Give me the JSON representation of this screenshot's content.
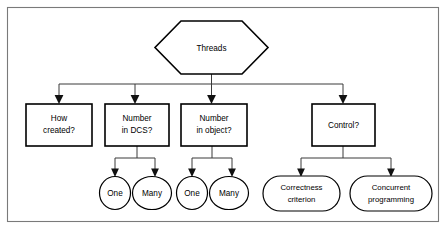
{
  "diagram": {
    "title": "Threads",
    "type": "tree-taxonomy",
    "frame": {
      "border_color": "#7a7a7a",
      "background": "#ffffff"
    },
    "root": {
      "id": "threads",
      "shape": "hexagon",
      "label": "Threads",
      "x": 155,
      "y": 21,
      "w": 113,
      "h": 53
    },
    "level1": [
      {
        "id": "how-created",
        "shape": "rectangle",
        "label_line1": "How",
        "label_line2": "created?",
        "x": 26,
        "y": 104,
        "w": 66,
        "h": 42,
        "children": []
      },
      {
        "id": "number-in-dcs",
        "shape": "rectangle",
        "label_line1": "Number",
        "label_line2": "in DCS?",
        "x": 105,
        "y": 104,
        "w": 64,
        "h": 42,
        "children": [
          "one-dcs",
          "many-dcs"
        ]
      },
      {
        "id": "number-in-object",
        "shape": "rectangle",
        "label_line1": "Number",
        "label_line2": "in object?",
        "x": 181,
        "y": 104,
        "w": 66,
        "h": 42,
        "children": [
          "one-object",
          "many-object"
        ]
      },
      {
        "id": "control",
        "shape": "rectangle",
        "label_line1": "Control?",
        "label_line2": "",
        "x": 312,
        "y": 104,
        "w": 63,
        "h": 42,
        "children": [
          "correctness-criterion",
          "concurrent-programming"
        ]
      }
    ],
    "level2": [
      {
        "id": "one-dcs",
        "shape": "ellipse",
        "label_line1": "One",
        "label_line2": "",
        "cx": 115,
        "cy": 193,
        "rx": 15.5,
        "ry": 16.5,
        "parent": "number-in-dcs"
      },
      {
        "id": "many-dcs",
        "shape": "ellipse",
        "label_line1": "Many",
        "label_line2": "",
        "cx": 152,
        "cy": 193,
        "rx": 19.5,
        "ry": 16.5,
        "parent": "number-in-dcs"
      },
      {
        "id": "one-object",
        "shape": "ellipse",
        "label_line1": "One",
        "label_line2": "",
        "cx": 192,
        "cy": 193,
        "rx": 15.5,
        "ry": 16.5,
        "parent": "number-in-object"
      },
      {
        "id": "many-object",
        "shape": "ellipse",
        "label_line1": "Many",
        "label_line2": "",
        "cx": 229,
        "cy": 193,
        "rx": 19.5,
        "ry": 16.5,
        "parent": "number-in-object"
      },
      {
        "id": "correctness-criterion",
        "shape": "stadium",
        "label_line1": "Correctness",
        "label_line2": "criterion",
        "x": 263,
        "y": 176,
        "w": 77,
        "h": 35,
        "parent": "control"
      },
      {
        "id": "concurrent-programming",
        "shape": "stadium",
        "label_line1": "Concurrent",
        "label_line2": "programming",
        "x": 350,
        "y": 176,
        "w": 82,
        "h": 35,
        "parent": "control"
      }
    ],
    "edges": [
      {
        "from": "threads",
        "to": "how-created"
      },
      {
        "from": "threads",
        "to": "number-in-dcs"
      },
      {
        "from": "threads",
        "to": "number-in-object"
      },
      {
        "from": "threads",
        "to": "control"
      },
      {
        "from": "number-in-dcs",
        "to": "one-dcs"
      },
      {
        "from": "number-in-dcs",
        "to": "many-dcs"
      },
      {
        "from": "number-in-object",
        "to": "one-object"
      },
      {
        "from": "number-in-object",
        "to": "many-object"
      },
      {
        "from": "control",
        "to": "correctness-criterion"
      },
      {
        "from": "control",
        "to": "concurrent-programming"
      }
    ]
  }
}
